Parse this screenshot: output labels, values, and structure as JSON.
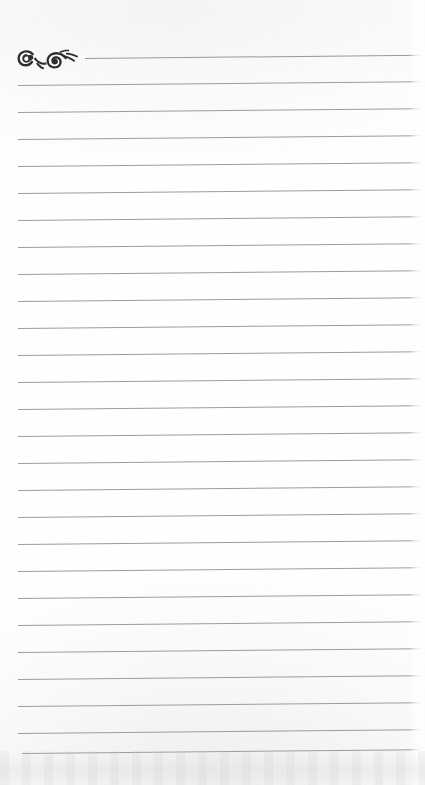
{
  "page": {
    "width": 425,
    "height": 785,
    "paper_color": "#fefefe",
    "rule_color": "#9b9ca0",
    "ornament_color": "#2e2d30",
    "content_text": ""
  },
  "ornament": {
    "name": "calligraphic-flourish",
    "description": "dark ornamental scroll flourish with two spiral curls at top-left of the page",
    "color": "#2e2d30"
  },
  "rules": {
    "count": 26,
    "spacing_px": 27,
    "first_line_y": 58,
    "last_line_y": 753,
    "left_margin_x": 18,
    "right_end_x": 420,
    "first_line_left_x": 85,
    "tilt_degrees": -0.55,
    "lines": [
      {
        "index": 1,
        "y": 58,
        "x_start": 85,
        "x_end": 420,
        "text": ""
      },
      {
        "index": 2,
        "y": 85,
        "x_start": 18,
        "x_end": 420,
        "text": ""
      },
      {
        "index": 3,
        "y": 112,
        "x_start": 18,
        "x_end": 420,
        "text": ""
      },
      {
        "index": 4,
        "y": 139,
        "x_start": 18,
        "x_end": 420,
        "text": ""
      },
      {
        "index": 5,
        "y": 166,
        "x_start": 18,
        "x_end": 420,
        "text": ""
      },
      {
        "index": 6,
        "y": 193,
        "x_start": 18,
        "x_end": 420,
        "text": ""
      },
      {
        "index": 7,
        "y": 220,
        "x_start": 18,
        "x_end": 420,
        "text": ""
      },
      {
        "index": 8,
        "y": 247,
        "x_start": 18,
        "x_end": 420,
        "text": ""
      },
      {
        "index": 9,
        "y": 274,
        "x_start": 18,
        "x_end": 420,
        "text": ""
      },
      {
        "index": 10,
        "y": 301,
        "x_start": 18,
        "x_end": 420,
        "text": ""
      },
      {
        "index": 11,
        "y": 328,
        "x_start": 18,
        "x_end": 420,
        "text": ""
      },
      {
        "index": 12,
        "y": 355,
        "x_start": 18,
        "x_end": 420,
        "text": ""
      },
      {
        "index": 13,
        "y": 382,
        "x_start": 18,
        "x_end": 420,
        "text": ""
      },
      {
        "index": 14,
        "y": 409,
        "x_start": 18,
        "x_end": 420,
        "text": ""
      },
      {
        "index": 15,
        "y": 436,
        "x_start": 18,
        "x_end": 420,
        "text": ""
      },
      {
        "index": 16,
        "y": 463,
        "x_start": 18,
        "x_end": 420,
        "text": ""
      },
      {
        "index": 17,
        "y": 490,
        "x_start": 18,
        "x_end": 420,
        "text": ""
      },
      {
        "index": 18,
        "y": 517,
        "x_start": 18,
        "x_end": 420,
        "text": ""
      },
      {
        "index": 19,
        "y": 544,
        "x_start": 18,
        "x_end": 420,
        "text": ""
      },
      {
        "index": 20,
        "y": 571,
        "x_start": 18,
        "x_end": 420,
        "text": ""
      },
      {
        "index": 21,
        "y": 598,
        "x_start": 18,
        "x_end": 420,
        "text": ""
      },
      {
        "index": 22,
        "y": 625,
        "x_start": 18,
        "x_end": 420,
        "text": ""
      },
      {
        "index": 23,
        "y": 652,
        "x_start": 18,
        "x_end": 420,
        "text": ""
      },
      {
        "index": 24,
        "y": 679,
        "x_start": 18,
        "x_end": 420,
        "text": ""
      },
      {
        "index": 25,
        "y": 706,
        "x_start": 18,
        "x_end": 420,
        "text": ""
      },
      {
        "index": 26,
        "y": 733,
        "x_start": 18,
        "x_end": 420,
        "text": ""
      },
      {
        "index": 27,
        "y": 753,
        "x_start": 22,
        "x_end": 420,
        "text": ""
      }
    ]
  }
}
